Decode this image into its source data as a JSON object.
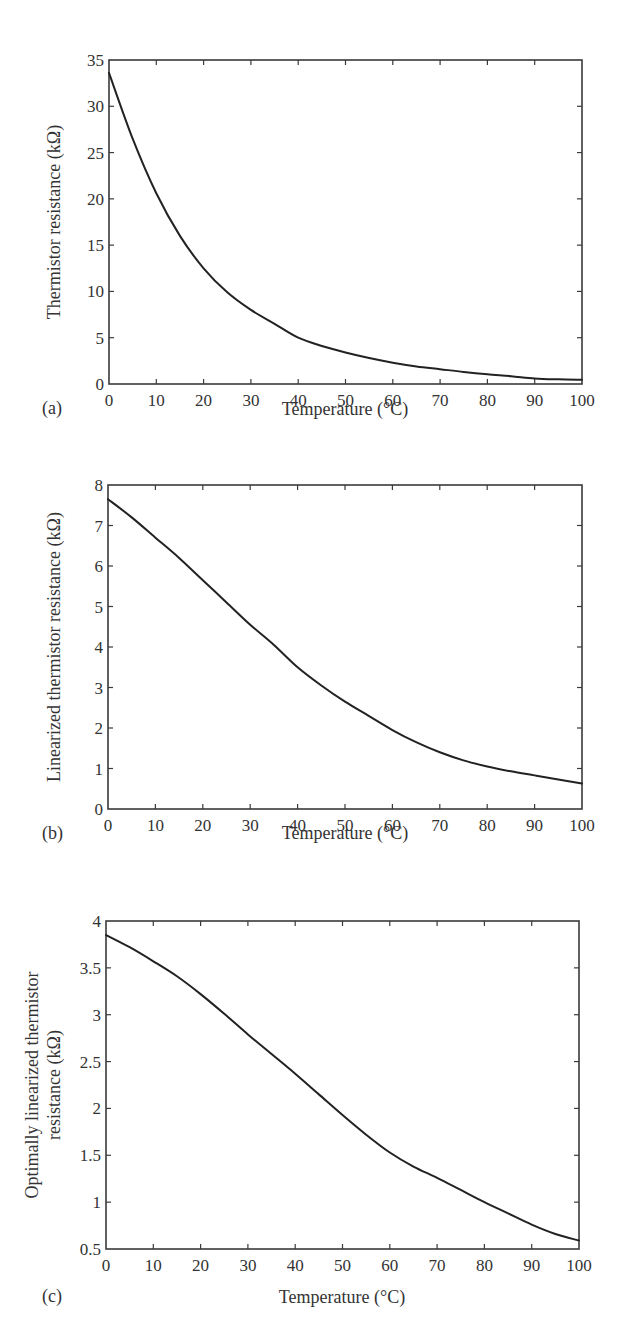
{
  "chart_data": [
    {
      "panel": "(a)",
      "type": "line",
      "title": "",
      "xlabel": "Temperature (°C)",
      "ylabel": "Thermistor resistance (kΩ)",
      "xlim": [
        0,
        100
      ],
      "ylim": [
        0,
        35
      ],
      "xticks": [
        0,
        10,
        20,
        30,
        40,
        50,
        60,
        70,
        80,
        90,
        100
      ],
      "yticks": [
        0,
        5,
        10,
        15,
        20,
        25,
        30,
        35
      ],
      "grid": false,
      "series": [
        {
          "name": "Thermistor resistance",
          "x": [
            0,
            5,
            10,
            15,
            20,
            25,
            30,
            35,
            40,
            45,
            50,
            55,
            60,
            65,
            70,
            75,
            80,
            85,
            90,
            95,
            100
          ],
          "y": [
            33.6,
            26.5,
            20.6,
            16.0,
            12.5,
            9.9,
            8.0,
            6.5,
            5.0,
            4.1,
            3.4,
            2.8,
            2.3,
            1.9,
            1.6,
            1.3,
            1.05,
            0.85,
            0.6,
            0.5,
            0.45
          ]
        }
      ]
    },
    {
      "panel": "(b)",
      "type": "line",
      "title": "",
      "xlabel": "Temperature (°C)",
      "ylabel": "Linearized thermistor resistance (kΩ)",
      "xlim": [
        0,
        100
      ],
      "ylim": [
        0,
        8
      ],
      "xticks": [
        0,
        10,
        20,
        30,
        40,
        50,
        60,
        70,
        80,
        90,
        100
      ],
      "yticks": [
        0,
        1,
        2,
        3,
        4,
        5,
        6,
        7,
        8
      ],
      "grid": false,
      "series": [
        {
          "name": "Linearized thermistor resistance",
          "x": [
            0,
            5,
            10,
            15,
            20,
            25,
            30,
            35,
            40,
            45,
            50,
            55,
            60,
            65,
            70,
            75,
            80,
            85,
            90,
            95,
            100
          ],
          "y": [
            7.65,
            7.2,
            6.7,
            6.2,
            5.65,
            5.1,
            4.55,
            4.05,
            3.5,
            3.05,
            2.65,
            2.3,
            1.95,
            1.65,
            1.4,
            1.2,
            1.05,
            0.93,
            0.83,
            0.73,
            0.63
          ]
        }
      ]
    },
    {
      "panel": "(c)",
      "type": "line",
      "title": "",
      "xlabel": "Temperature (°C)",
      "ylabel": "Optimally linearized thermistor resistance (kΩ)",
      "xlim": [
        0,
        100
      ],
      "ylim": [
        0.5,
        4
      ],
      "xticks": [
        0,
        10,
        20,
        30,
        40,
        50,
        60,
        70,
        80,
        90,
        100
      ],
      "yticks": [
        0.5,
        1,
        1.5,
        2,
        2.5,
        3,
        3.5,
        4
      ],
      "grid": false,
      "series": [
        {
          "name": "Optimally linearized thermistor resistance",
          "x": [
            0,
            5,
            10,
            15,
            20,
            25,
            30,
            35,
            40,
            45,
            50,
            55,
            60,
            65,
            70,
            75,
            80,
            85,
            90,
            95,
            100
          ],
          "y": [
            3.85,
            3.72,
            3.57,
            3.41,
            3.22,
            3.01,
            2.79,
            2.58,
            2.37,
            2.15,
            1.93,
            1.72,
            1.53,
            1.38,
            1.26,
            1.13,
            1.0,
            0.88,
            0.76,
            0.66,
            0.59
          ]
        }
      ]
    }
  ],
  "panels": {
    "a": {
      "tag": "(a)",
      "xlabel": "Temperature (°C)",
      "ylabel": "Thermistor resistance (kΩ)"
    },
    "b": {
      "tag": "(b)",
      "xlabel": "Temperature (°C)",
      "ylabel": "Linearized thermistor resistance (kΩ)"
    },
    "c": {
      "tag": "(c)",
      "xlabel": "Temperature (°C)",
      "ylabel_line1": "Optimally linearized thermistor",
      "ylabel_line2": "resistance (kΩ)"
    }
  }
}
